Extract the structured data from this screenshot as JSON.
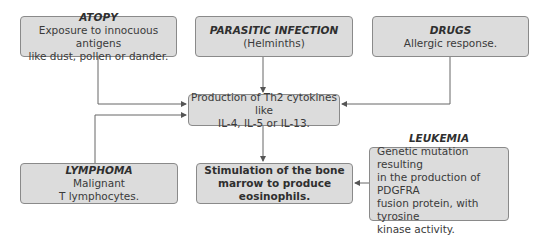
{
  "diagram": {
    "type": "flowchart",
    "nodes": {
      "atopy": {
        "title": "ATOPY",
        "line1": "Exposure to innocuous antigens",
        "line2": "like dust, pollen or dander."
      },
      "parasitic": {
        "title": "PARASITIC INFECTION",
        "line1": "(Helminths)"
      },
      "drugs": {
        "title": "DRUGS",
        "line1": "Allergic response."
      },
      "th2": {
        "line1": "Production of Th2 cytokines like",
        "line2": "IL-4, IL-5 or IL-13."
      },
      "lymphoma": {
        "title": "LYMPHOMA",
        "line1": "Malignant",
        "line2": "T lymphocytes."
      },
      "stimulation": {
        "line1": "Stimulation of the bone",
        "line2": "marrow to produce eosinophils."
      },
      "leukemia": {
        "title": "LEUKEMIA",
        "line1": "Genetic mutation resulting",
        "line2": "in the production of PDGFRA",
        "line3": "fusion protein, with tyrosine",
        "line4": "kinase activity."
      }
    },
    "edges": [
      {
        "from": "ATOPY",
        "to": "Production of Th2 cytokines"
      },
      {
        "from": "PARASITIC INFECTION",
        "to": "Production of Th2 cytokines"
      },
      {
        "from": "DRUGS",
        "to": "Production of Th2 cytokines"
      },
      {
        "from": "LYMPHOMA",
        "to": "Production of Th2 cytokines"
      },
      {
        "from": "Production of Th2 cytokines",
        "to": "Stimulation of the bone marrow"
      },
      {
        "from": "LEUKEMIA",
        "to": "Stimulation of the bone marrow"
      }
    ],
    "colors": {
      "box_fill": "#dcdcdc",
      "box_border": "#8a8a8a",
      "line": "#555555"
    }
  }
}
